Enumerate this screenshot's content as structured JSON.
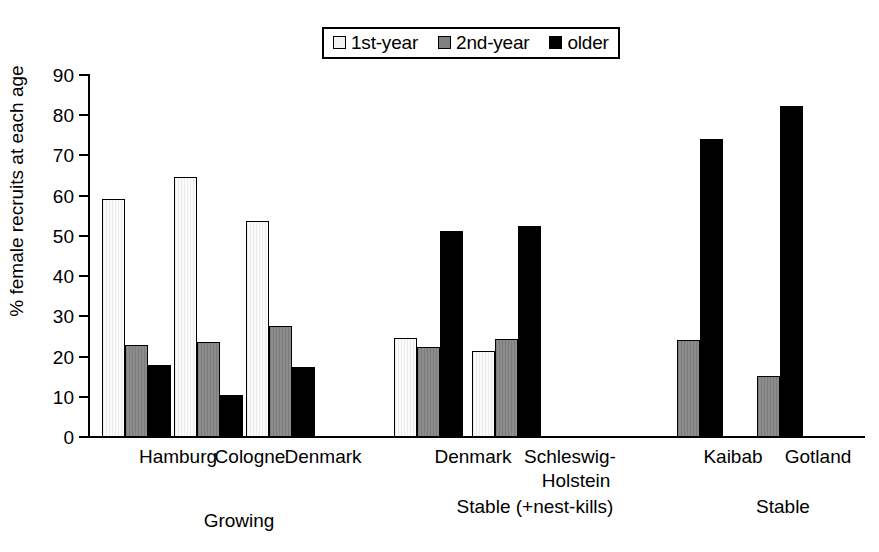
{
  "chart_data": {
    "type": "bar",
    "title": "",
    "xlabel": "",
    "ylabel": "% female recruits at each age",
    "ylim": [
      0,
      90
    ],
    "yticks": [
      0,
      10,
      20,
      30,
      40,
      50,
      60,
      70,
      80,
      90
    ],
    "grid": false,
    "legend_position": "top-center",
    "categories": [
      "Hamburg",
      "Cologne",
      "Denmark",
      "Denmark",
      "Schleswig-Holstein",
      "Kaibab",
      "Gotland"
    ],
    "series": [
      {
        "name": "1st-year",
        "color": "#f4f4f4",
        "values": [
          59.2,
          64.6,
          53.7,
          24.5,
          21.3,
          null,
          null
        ]
      },
      {
        "name": "2nd-year",
        "color": "#808080",
        "values": [
          23.0,
          23.6,
          27.7,
          22.3,
          24.4,
          24.1,
          15.2
        ]
      },
      {
        "name": "older",
        "color": "#000000",
        "values": [
          17.8,
          10.5,
          17.3,
          51.3,
          52.4,
          74.0,
          82.4
        ]
      }
    ],
    "groups": [
      {
        "label": "Growing",
        "categories": [
          "Hamburg",
          "Cologne",
          "Denmark"
        ]
      },
      {
        "label": "Stable (+nest-kills)",
        "categories": [
          "Denmark",
          "Schleswig-Holstein"
        ]
      },
      {
        "label": "Stable",
        "categories": [
          "Kaibab",
          "Gotland"
        ]
      }
    ]
  },
  "legend": {
    "entries": [
      {
        "label": "1st-year",
        "swatch": "swatch-1st-year"
      },
      {
        "label": "2nd-year",
        "swatch": "swatch-2nd-year"
      },
      {
        "label": "older",
        "swatch": "swatch-older"
      }
    ]
  },
  "axis": {
    "y_title": "% female recruits at each age",
    "y_ticks": [
      "90",
      "80",
      "70",
      "60",
      "50",
      "40",
      "30",
      "20",
      "10",
      "0"
    ]
  },
  "x_axis": {
    "tick_labels": [
      {
        "text": "Hamburg",
        "x": 128,
        "width": 100
      },
      {
        "text": "Cologne",
        "x": 200,
        "width": 100
      },
      {
        "text": "Denmark",
        "x": 268,
        "width": 110
      },
      {
        "text": "Denmark",
        "x": 418,
        "width": 110
      },
      {
        "text": "Schleswig-",
        "x": 510,
        "width": 120
      },
      {
        "text": "Holstein",
        "x": 516,
        "width": 120
      },
      {
        "text": "Kaibab",
        "x": 688,
        "width": 90
      },
      {
        "text": "Gotland",
        "x": 768,
        "width": 100
      }
    ],
    "group_labels": [
      {
        "text": "Growing",
        "x": 174,
        "width": 130
      },
      {
        "text": "Stable (+nest-kills)",
        "x": 420,
        "width": 230
      },
      {
        "text": "Stable",
        "x": 718,
        "width": 130
      }
    ]
  }
}
